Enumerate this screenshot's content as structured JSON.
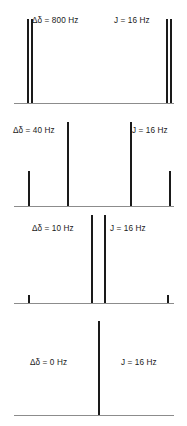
{
  "figure": {
    "width": 187,
    "height": 426,
    "peak_color": "#1a1a1a",
    "baseline_color": "#8c8c8c",
    "background_color": "#ffffff"
  },
  "panels": [
    {
      "id": "panel-800hz",
      "delta_label": "Δδ = 800 Hz",
      "j_label": "J = 16 Hz",
      "delta_value": 800,
      "j_value": 16,
      "baseline_y": 103,
      "label_y": 16,
      "delta_label_x": 32,
      "j_label_x": 114,
      "peaks": [
        {
          "x": 27,
          "height": 84,
          "width": 2
        },
        {
          "x": 31,
          "height": 84,
          "width": 2
        },
        {
          "x": 166,
          "height": 84,
          "width": 2
        },
        {
          "x": 170,
          "height": 84,
          "width": 2
        }
      ]
    },
    {
      "id": "panel-40hz",
      "delta_label": "Δδ = 40 Hz",
      "j_label": "J = 16 Hz",
      "delta_value": 40,
      "j_value": 16,
      "baseline_y": 206,
      "label_y": 126,
      "delta_label_x": 13,
      "j_label_x": 132,
      "peaks": [
        {
          "x": 28,
          "height": 35,
          "width": 2
        },
        {
          "x": 67,
          "height": 84,
          "width": 2
        },
        {
          "x": 130,
          "height": 84,
          "width": 2
        },
        {
          "x": 169,
          "height": 35,
          "width": 2
        }
      ]
    },
    {
      "id": "panel-10hz",
      "delta_label": "Δδ = 10 Hz",
      "j_label": "J = 16 Hz",
      "delta_value": 10,
      "j_value": 16,
      "baseline_y": 303,
      "label_y": 224,
      "delta_label_x": 32,
      "j_label_x": 110,
      "peaks": [
        {
          "x": 28,
          "height": 8,
          "width": 2
        },
        {
          "x": 91,
          "height": 88,
          "width": 2
        },
        {
          "x": 104,
          "height": 88,
          "width": 2
        },
        {
          "x": 167,
          "height": 8,
          "width": 2
        }
      ]
    },
    {
      "id": "panel-0hz",
      "delta_label": "Δδ = 0 Hz",
      "j_label": "J = 16 Hz",
      "delta_value": 0,
      "j_value": 16,
      "baseline_y": 415,
      "label_y": 358,
      "delta_label_x": 30,
      "j_label_x": 121,
      "peaks": [
        {
          "x": 98,
          "height": 94,
          "width": 2
        }
      ]
    }
  ]
}
